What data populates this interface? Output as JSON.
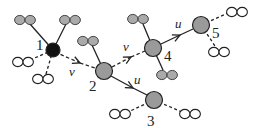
{
  "diagram": {
    "title": "",
    "colors": {
      "root_node": "#111111",
      "node": "#9a9a9a",
      "gray_leaf": "#aaaaaa",
      "white_leaf": "#ffffff",
      "stroke": "#222222"
    },
    "nodes": [
      {
        "id": "1",
        "label": "1",
        "x": 53,
        "y": 50,
        "r": 7,
        "kind": "root"
      },
      {
        "id": "2",
        "label": "2",
        "x": 104,
        "y": 71,
        "r": 8.5,
        "kind": "node"
      },
      {
        "id": "3",
        "label": "3",
        "x": 154,
        "y": 100,
        "r": 8.5,
        "kind": "node"
      },
      {
        "id": "4",
        "label": "4",
        "x": 153,
        "y": 48,
        "r": 8.5,
        "kind": "node"
      },
      {
        "id": "5",
        "label": "5",
        "x": 201,
        "y": 25,
        "r": 8.5,
        "kind": "node"
      }
    ],
    "edges": [
      {
        "from": "1",
        "to": "2",
        "label": "v",
        "style": "dashed",
        "arrow": true
      },
      {
        "from": "2",
        "to": "4",
        "label": "v",
        "style": "dashed",
        "arrow": true
      },
      {
        "from": "2",
        "to": "3",
        "label": "u",
        "style": "solid",
        "arrow": true
      },
      {
        "from": "4",
        "to": "5",
        "label": "u",
        "style": "solid",
        "arrow": true
      }
    ],
    "node_labels": {
      "n1": "1",
      "n2": "2",
      "n3": "3",
      "n4": "4",
      "n5": "5"
    },
    "edge_labels": {
      "e12": "v",
      "e24": "v",
      "e23": "u",
      "e45": "u"
    },
    "leaves": [
      {
        "attached_to": "1",
        "type": "gray",
        "style": "solid",
        "x": 25,
        "y": 20
      },
      {
        "attached_to": "1",
        "type": "gray",
        "style": "solid",
        "x": 70,
        "y": 20
      },
      {
        "attached_to": "1",
        "type": "white",
        "style": "dashed",
        "x": 23,
        "y": 62
      },
      {
        "attached_to": "1",
        "type": "white",
        "style": "dashed",
        "x": 43,
        "y": 79
      },
      {
        "attached_to": "2",
        "type": "gray",
        "style": "solid",
        "x": 88,
        "y": 41
      },
      {
        "attached_to": "4",
        "type": "gray",
        "style": "solid",
        "x": 138,
        "y": 19
      },
      {
        "attached_to": "4",
        "type": "gray",
        "style": "solid",
        "x": 167,
        "y": 75
      },
      {
        "attached_to": "3",
        "type": "white",
        "style": "dashed",
        "x": 120,
        "y": 114
      },
      {
        "attached_to": "3",
        "type": "white",
        "style": "dashed",
        "x": 190,
        "y": 114
      },
      {
        "attached_to": "5",
        "type": "white",
        "style": "dashed",
        "x": 237,
        "y": 12
      },
      {
        "attached_to": "5",
        "type": "white",
        "style": "dashed",
        "x": 219,
        "y": 52
      }
    ]
  }
}
